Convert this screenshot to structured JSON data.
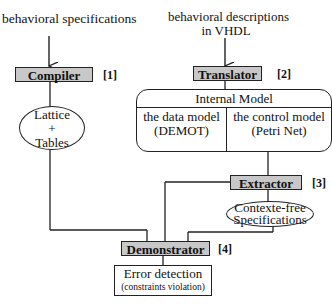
{
  "inputs": {
    "left": "behavioral specifications",
    "right_line1": "behavioral descriptions",
    "right_line2": "in VHDL"
  },
  "processes": {
    "compiler": {
      "label": "Compiler",
      "ref": "[1]"
    },
    "translator": {
      "label": "Translator",
      "ref": "[2]"
    },
    "extractor": {
      "label": "Extractor",
      "ref": "[3]"
    },
    "demonstrator": {
      "label": "Demonstrator",
      "ref": "[4]"
    }
  },
  "data_stores": {
    "lattice": {
      "line1": "Lattice",
      "line2": "+",
      "line3": "Tables"
    },
    "context_free": {
      "line1": "Contexte-free",
      "line2": "Specifications"
    }
  },
  "internal_model": {
    "title": "Internal Model",
    "data_model": {
      "line1": "the data model",
      "line2": "(DEMOT)"
    },
    "control_model": {
      "line1": "the control model",
      "line2": "(Petri  Net)"
    }
  },
  "output": {
    "line1": "Error detection",
    "line2": "(constraints  violation)"
  },
  "colors": {
    "process_fill": "#c8c8c8",
    "line": "#222222"
  }
}
